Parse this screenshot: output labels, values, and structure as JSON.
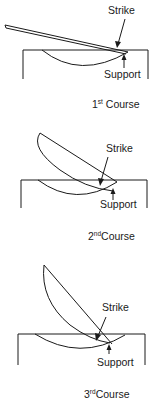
{
  "figure": {
    "panels": [
      {
        "id": "course-1",
        "strike_label": "Strike",
        "support_label": "Support",
        "course_number": "1",
        "course_suffix": "st",
        "course_word": "Course"
      },
      {
        "id": "course-2",
        "strike_label": "Strike",
        "support_label": "Support",
        "course_number": "2",
        "course_suffix": "nd",
        "course_word": "Course"
      },
      {
        "id": "course-3",
        "strike_label": "Strike",
        "support_label": "Support",
        "course_number": "3",
        "course_suffix": "rd",
        "course_word": "Course"
      }
    ],
    "line_color": "#1a1a1a"
  }
}
